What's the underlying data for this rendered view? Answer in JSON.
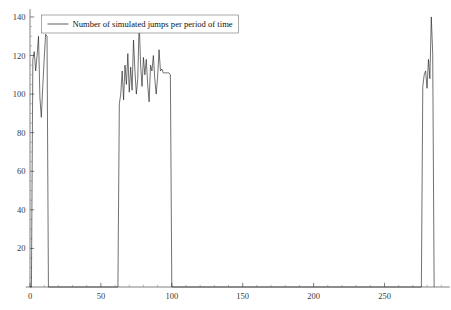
{
  "chart_data": {
    "type": "line",
    "title": "",
    "subtitle": "",
    "xlabel": "",
    "ylabel": "",
    "xlim": [
      -3,
      296
    ],
    "ylim": [
      0,
      144
    ],
    "grid": false,
    "legend_position": "top-left",
    "legend": [
      "Number of simulated jumps per period of time"
    ],
    "xticks": [
      0,
      50,
      100,
      150,
      200,
      250
    ],
    "xtick_labels": [
      "0",
      "50",
      "100",
      "150",
      "200",
      "250"
    ],
    "x_minor_step": 10,
    "yticks": [
      20,
      40,
      60,
      80,
      100,
      120,
      140
    ],
    "ytick_labels": [
      "20",
      "40",
      "60",
      "80",
      "100",
      "120",
      "140"
    ],
    "y_minor_step": 5,
    "series": [
      {
        "name": "Number of simulated jumps per period of time",
        "color": "#1a1a1a",
        "x": [
          0,
          1,
          2,
          3,
          4,
          5,
          6,
          7,
          8,
          9,
          10,
          11,
          12,
          13,
          62,
          63,
          64,
          65,
          66,
          67,
          68,
          69,
          70,
          71,
          72,
          73,
          74,
          75,
          76,
          77,
          78,
          79,
          80,
          81,
          82,
          83,
          84,
          85,
          86,
          87,
          88,
          89,
          90,
          91,
          92,
          93,
          94,
          95,
          96,
          97,
          98,
          99,
          100,
          276,
          277,
          278,
          279,
          280,
          281,
          282,
          283,
          284,
          285
        ],
        "y": [
          0,
          0,
          118,
          122,
          112,
          120,
          130,
          98,
          88,
          104,
          118,
          131,
          130,
          0,
          0,
          95,
          100,
          112,
          97,
          115,
          105,
          121,
          101,
          114,
          102,
          128,
          112,
          100,
          108,
          138,
          115,
          104,
          119,
          110,
          118,
          105,
          96,
          115,
          112,
          120,
          108,
          100,
          109,
          123,
          112,
          113,
          111,
          111,
          111,
          111,
          111,
          110,
          0,
          0,
          104,
          110,
          112,
          103,
          118,
          108,
          140,
          121,
          0
        ]
      }
    ]
  },
  "axes": {
    "y_axis_name": "y-axis",
    "x_axis_name": "x-axis"
  }
}
